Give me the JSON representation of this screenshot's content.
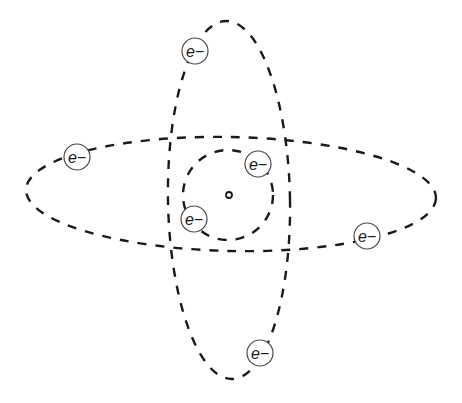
{
  "diagram": {
    "type": "atom-model",
    "colors": {
      "line": "#1a1a1a",
      "electron_ring": "#4a4a4a",
      "background": "#ffffff"
    },
    "nucleus": {
      "cx": 229,
      "cy": 195,
      "r": 3
    },
    "orbits": [
      {
        "name": "inner-orbit",
        "shape": "circle",
        "cx": 228,
        "cy": 195,
        "rx": 45,
        "ry": 45,
        "rotate": 0
      },
      {
        "name": "horizontal-orbit",
        "shape": "ellipse",
        "cx": 231,
        "cy": 194,
        "rx": 205,
        "ry": 57,
        "rotate": 1.2
      },
      {
        "name": "vertical-orbit",
        "shape": "ellipse",
        "cx": 229,
        "cy": 200,
        "rx": 61,
        "ry": 179,
        "rotate": -1
      }
    ],
    "electrons": [
      {
        "name": "electron-top",
        "label": "e−",
        "cx": 195,
        "cy": 51
      },
      {
        "name": "electron-left",
        "label": "e−",
        "cx": 77,
        "cy": 157
      },
      {
        "name": "electron-inner-upper",
        "label": "e−",
        "cx": 258,
        "cy": 164
      },
      {
        "name": "electron-inner-lower",
        "label": "e−",
        "cx": 194,
        "cy": 219
      },
      {
        "name": "electron-right",
        "label": "e−",
        "cx": 367,
        "cy": 236
      },
      {
        "name": "electron-bottom",
        "label": "e−",
        "cx": 260,
        "cy": 353
      }
    ],
    "electron_radius": 13
  }
}
